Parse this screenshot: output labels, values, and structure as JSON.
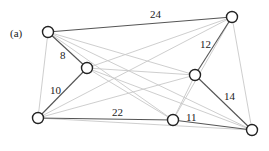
{
  "panel_label": "(a)",
  "nodes": [
    {
      "id": "A",
      "x": 48,
      "y": 32
    },
    {
      "id": "B",
      "x": 87,
      "y": 68
    },
    {
      "id": "C",
      "x": 232,
      "y": 17
    },
    {
      "id": "D",
      "x": 195,
      "y": 75
    },
    {
      "id": "E",
      "x": 38,
      "y": 118
    },
    {
      "id": "F",
      "x": 173,
      "y": 120
    },
    {
      "id": "G",
      "x": 252,
      "y": 130
    }
  ],
  "weighted_edges": [
    {
      "from": "A",
      "to": "C",
      "weight": "24",
      "lx": 150,
      "ly": 18
    },
    {
      "from": "A",
      "to": "B",
      "weight": "8",
      "lx": 60,
      "ly": 59
    },
    {
      "from": "C",
      "to": "D",
      "weight": "12",
      "lx": 200,
      "ly": 48
    },
    {
      "from": "B",
      "to": "E",
      "weight": "10",
      "lx": 50,
      "ly": 94
    },
    {
      "from": "D",
      "to": "G",
      "weight": "14",
      "lx": 224,
      "ly": 100
    },
    {
      "from": "E",
      "to": "F",
      "weight": "22",
      "lx": 112,
      "ly": 116
    },
    {
      "from": "F",
      "to": "G",
      "weight": "11",
      "lx": 186,
      "ly": 121
    }
  ],
  "light_edges": [
    [
      "A",
      "D"
    ],
    [
      "A",
      "F"
    ],
    [
      "A",
      "G"
    ],
    [
      "A",
      "E"
    ],
    [
      "B",
      "C"
    ],
    [
      "B",
      "D"
    ],
    [
      "B",
      "F"
    ],
    [
      "B",
      "G"
    ],
    [
      "C",
      "E"
    ],
    [
      "C",
      "F"
    ],
    [
      "C",
      "G"
    ],
    [
      "D",
      "E"
    ],
    [
      "D",
      "F"
    ],
    [
      "E",
      "G"
    ]
  ],
  "colors": {
    "weighted_edge": "#555555",
    "light_edge": "#c8c8c8",
    "node_stroke": "#222222",
    "node_fill": "#ffffff"
  }
}
